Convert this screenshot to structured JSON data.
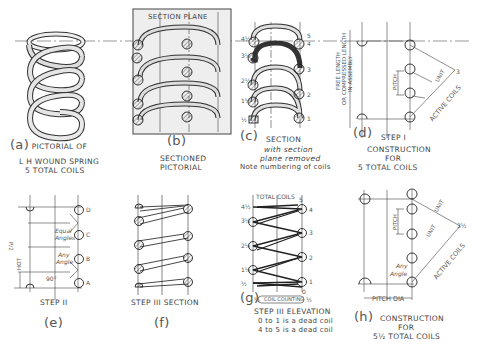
{
  "panels": {
    "a": {
      "letter": "(a)",
      "lines": [
        "PICTORIAL OF",
        "L H  WOUND SPRING",
        "5  TOTAL COILS"
      ]
    },
    "b": {
      "letter": "(b)",
      "header": "SECTION  PLANE",
      "lines": [
        "SECTIONED",
        "PICTORIAL"
      ]
    },
    "c": {
      "letter": "(c)",
      "title": "SECTION",
      "lines": [
        "with section",
        "plane removed",
        "Note numbering of coils"
      ],
      "left_numbers": [
        "4½",
        "3½",
        "2½",
        "1½",
        "½"
      ],
      "right_numbers": [
        "5",
        "4",
        "3",
        "2",
        "1"
      ]
    },
    "d": {
      "letter": "(d)",
      "step": "STEP I",
      "lines": [
        "CONSTRUCTION",
        "FOR",
        "5 TOTAL  COILS"
      ],
      "vertical_label_1": "FREE  LENGTH",
      "vertical_label_2": "OR COMPRESSED LENGTH",
      "vertical_label_3": "IN  ASSEMBLY",
      "pitch": "PITCH",
      "unit": "UNIT",
      "active_coils": "ACTIVE  COILS",
      "numbers": [
        "1",
        "2",
        "3"
      ]
    },
    "e": {
      "letter": "(e)",
      "step": "STEP II",
      "points": [
        "D",
        "C",
        "B",
        "A"
      ],
      "equal_angles": [
        "Equal",
        "Angles"
      ],
      "any_angle": [
        "Any",
        "Angle"
      ],
      "angle": "90°",
      "pitch_label": "HOT",
      "pitch_sub": "P/2"
    },
    "f": {
      "letter": "(f)",
      "step": "STEP III  SECTION"
    },
    "g": {
      "letter": "(g)",
      "step": "STEP III  ELEVATION",
      "lines": [
        "0 to 1  is a dead coil",
        "4 to 5  is a dead coil"
      ],
      "total_coils": "TOTAL  COILS",
      "coil_counting": "COIL  COUNTING",
      "left_numbers": [
        "4½",
        "3½",
        "2½",
        "1½",
        "½"
      ],
      "right_numbers": [
        "5",
        "4",
        "3",
        "2",
        "1",
        "0"
      ],
      "bottom_left": "½",
      "bottom_right": "½"
    },
    "h": {
      "letter": "(h)",
      "lines": [
        "CONSTRUCTION",
        "FOR",
        "5½ TOTAL  COILS"
      ],
      "pitch": "PITCH",
      "unit": "UNIT",
      "active_coils": "ACTIVE  COILS",
      "any_angle": [
        "Any",
        "Angle"
      ],
      "pitch_dia": "PITCH  DIA",
      "numbers": [
        "1",
        "2",
        "3",
        "3½"
      ]
    }
  }
}
